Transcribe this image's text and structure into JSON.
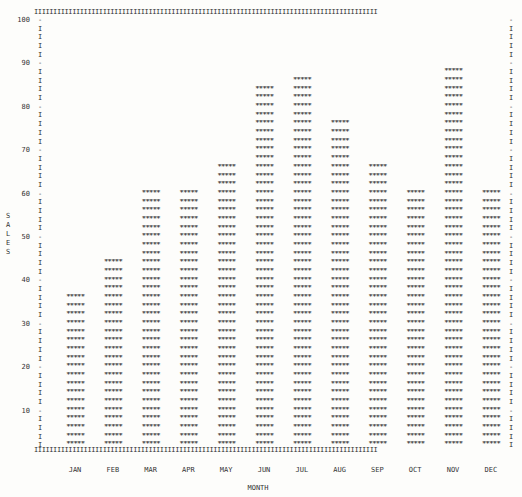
{
  "chart_data": {
    "type": "bar",
    "title": "",
    "xlabel": "MONTH",
    "ylabel": "SALES",
    "ylim": [
      0,
      100
    ],
    "yticks": [
      10,
      20,
      30,
      40,
      50,
      60,
      70,
      80,
      90,
      100
    ],
    "categories": [
      "JAN",
      "FEB",
      "MAR",
      "APR",
      "MAY",
      "JUN",
      "JUL",
      "AUG",
      "SEP",
      "OCT",
      "NOV",
      "DEC"
    ],
    "values": [
      36,
      44,
      60,
      60,
      66,
      84,
      86,
      76,
      66,
      60,
      88,
      60
    ],
    "bar_glyph": "*****",
    "units_per_row": 2,
    "grid": false,
    "legend": null
  },
  "frame": {
    "border_glyph": "I",
    "tick_glyph": "-"
  },
  "ylabel_letters": [
    "S",
    "A",
    "L",
    "E",
    "S"
  ]
}
